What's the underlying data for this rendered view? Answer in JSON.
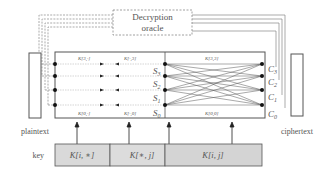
{
  "oracle": {
    "line1": "Decryption",
    "line2": "oracle"
  },
  "labels": {
    "plaintext": "plaintext",
    "ciphertext": "ciphertext",
    "key": "key"
  },
  "states": {
    "left": [
      "S",
      "S",
      "S",
      "S"
    ],
    "left_sub": [
      "3",
      "2",
      "1",
      "0"
    ]
  },
  "outputs": {
    "names": [
      "C",
      "C",
      "C",
      "C"
    ],
    "subs": [
      "3",
      "2",
      "1",
      "0"
    ]
  },
  "inner_labels": {
    "top_left": "K[3,·]",
    "top_mid": "K[·,3]",
    "top_right": "K[3,3]",
    "bottom_left": "K[0,·]",
    "bottom_mid": "K[·,0]",
    "bottom_right": "K[0,0]"
  },
  "key_segments": [
    {
      "label": "K[i, ∗]"
    },
    {
      "label": "K[∗, j]"
    },
    {
      "label": "K[i, j]"
    }
  ],
  "colors": {
    "stroke": "#555555",
    "key_fill": "#d9d9d9",
    "oracle_dash": "#888888",
    "wire": "#999999",
    "dot": "#111111"
  }
}
